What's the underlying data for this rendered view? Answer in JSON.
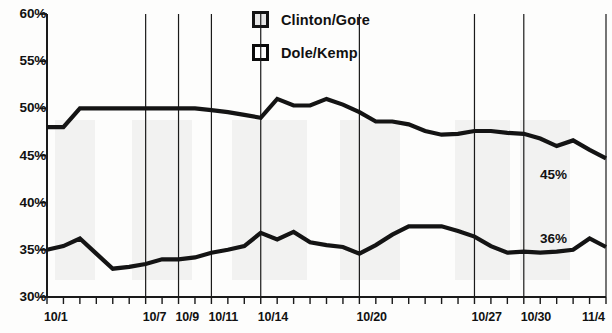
{
  "chart_data": {
    "type": "line",
    "title": "",
    "xlabel": "",
    "ylabel": "",
    "ylim": [
      30,
      60
    ],
    "yticks": [
      30,
      35,
      40,
      45,
      50,
      55,
      60
    ],
    "ytick_labels": [
      "30%",
      "35%",
      "40%",
      "45%",
      "50%",
      "55%",
      "60%"
    ],
    "grid": true,
    "legend_position": "top-center",
    "x": [
      "10/1",
      "10/2",
      "10/3",
      "10/4",
      "10/5",
      "10/6",
      "10/7",
      "10/8",
      "10/9",
      "10/10",
      "10/11",
      "10/12",
      "10/13",
      "10/14",
      "10/15",
      "10/16",
      "10/17",
      "10/18",
      "10/19",
      "10/20",
      "10/21",
      "10/22",
      "10/23",
      "10/24",
      "10/25",
      "10/26",
      "10/27",
      "10/28",
      "10/29",
      "10/30",
      "10/31",
      "11/1",
      "11/2",
      "11/3",
      "11/4"
    ],
    "xtick_labels": [
      "10/1",
      "10/7",
      "10/9",
      "10/11",
      "10/14",
      "10/20",
      "10/27",
      "10/30",
      "11/4"
    ],
    "xtick_values": [
      "10/1",
      "10/7",
      "10/9",
      "10/11",
      "10/14",
      "10/20",
      "10/27",
      "10/30",
      "11/4"
    ],
    "series": [
      {
        "name": "Clinton/Gore",
        "color": "#141414",
        "end_label": "45%",
        "values": [
          48,
          48,
          50,
          50,
          50,
          50,
          50,
          50,
          50,
          50,
          49.8,
          49.6,
          49.3,
          49,
          51,
          50.3,
          50.3,
          51,
          50.4,
          49.6,
          48.6,
          48.6,
          48.3,
          47.6,
          47.2,
          47.3,
          47.6,
          47.6,
          47.4,
          47.3,
          46.8,
          46,
          46.6,
          45.6,
          44.7
        ]
      },
      {
        "name": "Dole/Kemp",
        "color": "#141414",
        "end_label": "36%",
        "values": [
          35,
          35.4,
          36.2,
          34.6,
          33,
          33.2,
          33.5,
          34,
          34,
          34.2,
          34.7,
          35,
          35.4,
          36.8,
          36.1,
          36.9,
          35.8,
          35.5,
          35.3,
          34.6,
          35.5,
          36.6,
          37.5,
          37.5,
          37.5,
          37,
          36.4,
          35.4,
          34.7,
          34.8,
          34.7,
          34.8,
          35,
          36.2,
          35.3
        ]
      }
    ]
  },
  "legend": {
    "items": [
      {
        "label": "Clinton/Gore",
        "swatch": "filled-square-icon"
      },
      {
        "label": "Dole/Kemp",
        "swatch": "empty-square-icon"
      }
    ]
  },
  "ghost_artifacts": [
    "50%",
    "50%",
    "50%",
    "45%",
    "48%",
    "47%",
    "45%",
    "45%",
    "36%"
  ]
}
